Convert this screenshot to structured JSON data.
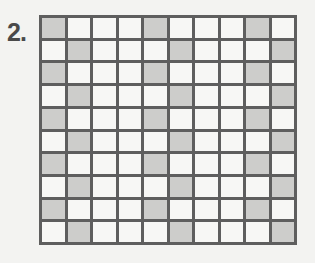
{
  "problem_label": "2.",
  "grid": {
    "rows": 10,
    "columns": 10,
    "shaded_color": "#cdcdcb",
    "unshaded_color": "#f7f7f5",
    "line_color": "#5e5e5e",
    "shaded_cells": [
      [
        1,
        5,
        9
      ],
      [
        2,
        6,
        10
      ],
      [
        1,
        5,
        9
      ],
      [
        2,
        6,
        10
      ],
      [
        1,
        5,
        9
      ],
      [
        2,
        6,
        10
      ],
      [
        1,
        5,
        9
      ],
      [
        2,
        6,
        10
      ],
      [
        1,
        5,
        9
      ],
      [
        2,
        6,
        10
      ]
    ],
    "shaded_count": 30,
    "total_cells": 100
  }
}
